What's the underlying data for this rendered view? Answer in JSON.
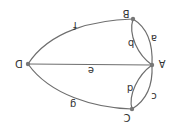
{
  "diagram": {
    "orientation": "rotated 180 degrees",
    "nodes": [
      {
        "id": "A",
        "label": "A",
        "x": 152,
        "y": 65
      },
      {
        "id": "B",
        "label": "B",
        "x": 133,
        "y": 19
      },
      {
        "id": "C",
        "label": "C",
        "x": 132,
        "y": 109
      },
      {
        "id": "D",
        "label": "D",
        "x": 28,
        "y": 64
      }
    ],
    "edges": [
      {
        "label": "a",
        "from": "B",
        "to": "A"
      },
      {
        "label": "b",
        "from": "B",
        "to": "A"
      },
      {
        "label": "c",
        "from": "A",
        "to": "C"
      },
      {
        "label": "d",
        "from": "A",
        "to": "C"
      },
      {
        "label": "e",
        "from": "D",
        "to": "A"
      },
      {
        "label": "f",
        "from": "D",
        "to": "B"
      },
      {
        "label": "g",
        "from": "D",
        "to": "C"
      }
    ],
    "colors": {
      "edge": "#6e6e6e",
      "node": "#777777",
      "text": "#333333"
    }
  }
}
